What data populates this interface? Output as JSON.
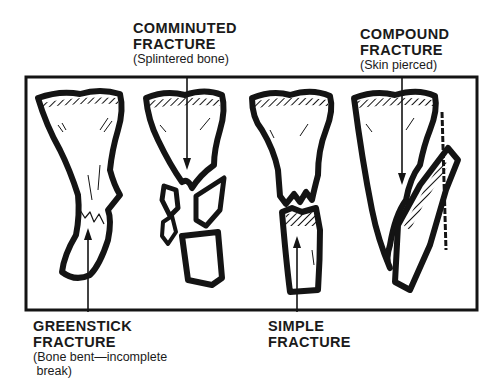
{
  "figure": {
    "labels": {
      "comminuted": {
        "title1": "COMMINUTED",
        "title2": "FRACTURE",
        "sub": "(Splintered bone)"
      },
      "compound": {
        "title1": "COMPOUND",
        "title2": "FRACTURE",
        "sub": "(Skin pierced)"
      },
      "greenstick": {
        "title1": "GREENSTICK",
        "title2": "FRACTURE",
        "sub1": "(Bone bent—incomplete",
        "sub2": " break)"
      },
      "simple": {
        "title1": "SIMPLE",
        "title2": "FRACTURE"
      }
    },
    "colors": {
      "ink": "#141414",
      "background": "#ffffff"
    }
  }
}
